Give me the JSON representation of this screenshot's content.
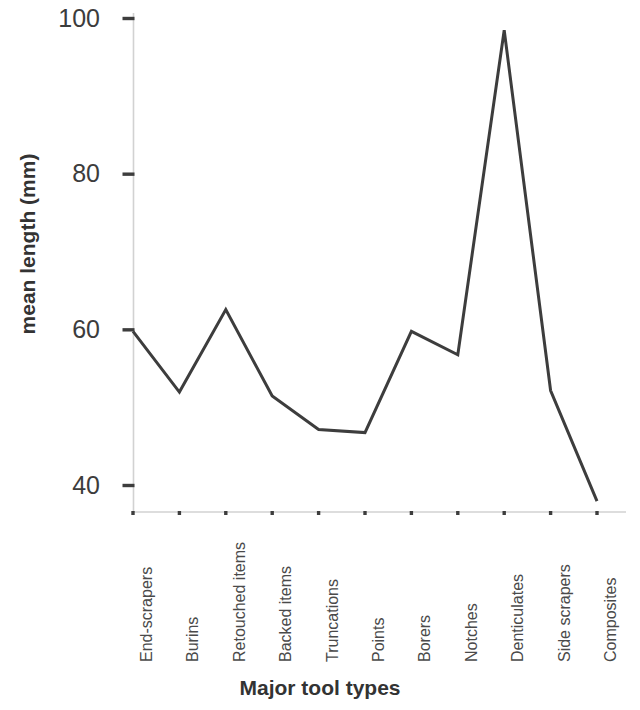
{
  "chart_data": {
    "type": "line",
    "title": "",
    "xlabel": "Major tool types",
    "ylabel": "mean length (mm)",
    "categories": [
      "End-scrapers",
      "Burins",
      "Retouched items",
      "Backed items",
      "Truncations",
      "Points",
      "Borers",
      "Notches",
      "Denticulates",
      "Side scrapers",
      "Composites"
    ],
    "values": [
      59.8,
      52.0,
      62.6,
      51.5,
      47.2,
      46.8,
      59.8,
      56.8,
      98.5,
      52.2,
      38.0
    ],
    "series": [
      {
        "name": "mean length",
        "values": [
          59.8,
          52.0,
          62.6,
          51.5,
          47.2,
          46.8,
          59.8,
          56.8,
          98.5,
          52.2,
          38.0
        ]
      }
    ],
    "ylim": [
      33,
      103
    ],
    "yticks": [
      40,
      60,
      80,
      100
    ],
    "ytick_labels": [
      "40",
      "60",
      "80",
      "100"
    ],
    "grid": false,
    "legend": null,
    "line_color": "#3d3d3d",
    "line_width": 3,
    "axis_color": "#cfcfcf",
    "tick_color": "#3d3d3d"
  },
  "axes": {
    "y_title": "mean length (mm)",
    "x_title": "Major tool types"
  }
}
